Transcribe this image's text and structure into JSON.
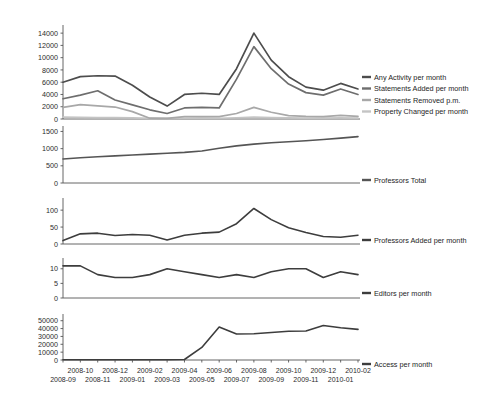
{
  "chart_data": {
    "type": "line",
    "title": "",
    "xlabel": "",
    "grid": false,
    "legend_position": "right",
    "x": [
      "2008-09",
      "2008-10",
      "2008-11",
      "2008-12",
      "2009-01",
      "2009-02",
      "2009-03",
      "2009-04",
      "2009-05",
      "2009-06",
      "2009-07",
      "2009-08",
      "2009-09",
      "2009-10",
      "2009-11",
      "2009-12",
      "2010-01",
      "2010-02"
    ],
    "panels": [
      {
        "name": "activity",
        "ylabel": "",
        "ylim": [
          0,
          15000
        ],
        "yticks": [
          0,
          2000,
          4000,
          6000,
          8000,
          10000,
          12000,
          14000
        ],
        "ytick_labels": [
          "0",
          "2000",
          "4000",
          "6000",
          "8000",
          "10000",
          "12000",
          "14000"
        ],
        "series": [
          {
            "name": "Any Activity per month",
            "color": "#4d4d4d",
            "values": [
              6000,
              6900,
              7050,
              7000,
              5500,
              3600,
              2100,
              4000,
              4200,
              4000,
              8200,
              14000,
              9600,
              6900,
              5200,
              4700,
              5800,
              4900
            ]
          },
          {
            "name": "Statements Added per month",
            "color": "#6e6e6e",
            "values": [
              3300,
              3900,
              4600,
              3100,
              2300,
              1500,
              900,
              1800,
              1900,
              1800,
              6500,
              11800,
              8200,
              5700,
              4300,
              3900,
              4900,
              4000
            ]
          },
          {
            "name": "Statements Removed p.m.",
            "color": "#a8a8a8",
            "values": [
              1900,
              2350,
              2150,
              1950,
              1200,
              130,
              110,
              390,
              400,
              380,
              900,
              1900,
              1100,
              550,
              420,
              400,
              600,
              430
            ]
          },
          {
            "name": "Property Changed per month",
            "color": "#c4c4c4",
            "values": [
              300,
              260,
              240,
              220,
              180,
              100,
              90,
              120,
              130,
              120,
              200,
              320,
              240,
              180,
              150,
              150,
              180,
              150
            ]
          }
        ]
      },
      {
        "name": "professors-total",
        "ylabel": "",
        "ylim": [
          0,
          1600
        ],
        "yticks": [
          0,
          500,
          1000,
          1500
        ],
        "ytick_labels": [
          "0",
          "500",
          "1000",
          "1500"
        ],
        "series": [
          {
            "name": "Professors Total",
            "color": "#555555",
            "values": [
              700,
              735,
              765,
              790,
              815,
              840,
              865,
              890,
              930,
              1010,
              1080,
              1130,
              1170,
              1200,
              1230,
              1265,
              1305,
              1350
            ]
          }
        ]
      },
      {
        "name": "professors-added",
        "ylabel": "",
        "ylim": [
          0,
          130
        ],
        "yticks": [
          0,
          50,
          100
        ],
        "ytick_labels": [
          "0",
          "50",
          "100"
        ],
        "series": [
          {
            "name": "Professors Added per month",
            "color": "#3d3d3d",
            "values": [
              10,
              30,
              32,
              25,
              28,
              26,
              12,
              26,
              32,
              35,
              60,
              105,
              72,
              48,
              34,
              22,
              20,
              26
            ]
          }
        ]
      },
      {
        "name": "editors",
        "ylabel": "",
        "ylim": [
          0,
          13
        ],
        "yticks": [
          0,
          5,
          10
        ],
        "ytick_labels": [
          "0",
          "5",
          "10"
        ],
        "series": [
          {
            "name": "Editors per month",
            "color": "#3d3d3d",
            "values": [
              11,
              11,
              8,
              7,
              7,
              8,
              10,
              9,
              8,
              7,
              8,
              7,
              9,
              10,
              10,
              7,
              9,
              8
            ]
          }
        ]
      },
      {
        "name": "access",
        "ylabel": "",
        "ylim": [
          0,
          56000
        ],
        "yticks": [
          0,
          10000,
          20000,
          30000,
          40000,
          50000
        ],
        "ytick_labels": [
          "0",
          "10000",
          "20000",
          "30000",
          "40000",
          "50000"
        ],
        "series": [
          {
            "name": "Access per month",
            "color": "#3d3d3d",
            "values": [
              300,
              300,
              300,
              300,
              300,
              300,
              350,
              600,
              16000,
              42000,
              33000,
              33500,
              35000,
              36500,
              37000,
              44000,
              41000,
              39000
            ]
          }
        ]
      }
    ],
    "xtick_labels_row1": [
      "2008-10",
      "2008-12",
      "2009-02",
      "2009-04",
      "2009-06",
      "2009-08",
      "2009-10",
      "2009-12",
      "2010-02"
    ],
    "xtick_labels_row2": [
      "2008-09",
      "2008-11",
      "2009-01",
      "2009-03",
      "2009-05",
      "2009-07",
      "2009-09",
      "2009-11",
      "2010-01"
    ]
  },
  "legends": {
    "panel1": [
      "Any Activity per month",
      "Statements Added per month",
      "Statements Removed p.m.",
      "Property Changed per month"
    ],
    "panel2": "Professors Total",
    "panel3": "Professors Added per month",
    "panel4": "Editors per month",
    "panel5": "Access per month"
  }
}
